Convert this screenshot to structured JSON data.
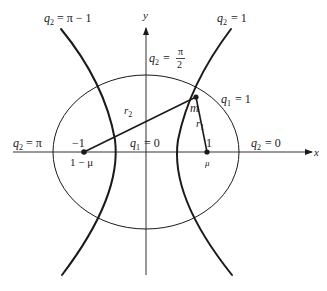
{
  "figure": {
    "axes": {
      "x_label": "x",
      "y_label": "y"
    },
    "labels": {
      "q2_pi_minus_1": {
        "var": "q",
        "sub": "2",
        "eq": "= π − 1"
      },
      "q2_one": {
        "var": "q",
        "sub": "2",
        "eq": "= 1"
      },
      "q2_pi_over_2": {
        "var": "q",
        "sub": "2",
        "eq": "=",
        "num": "π",
        "den": "2"
      },
      "q2_pi": {
        "var": "q",
        "sub": "2",
        "eq": "= π"
      },
      "q2_zero": {
        "var": "q",
        "sub": "2",
        "eq": "= 0"
      },
      "q1_zero": {
        "var": "q",
        "sub": "1",
        "eq": "= 0"
      },
      "q1_one": {
        "var": "q",
        "sub": "1",
        "eq": "= 1"
      }
    },
    "points": {
      "left_primary": {
        "top_label": "−1",
        "bottom_label": "1 − μ"
      },
      "right_primary": {
        "top_label": "1",
        "bottom_label": "μ"
      },
      "mass": {
        "label": "m"
      }
    },
    "segments": {
      "r1": {
        "var": "r",
        "sub": "1"
      },
      "r2": {
        "var": "r",
        "sub": "2"
      }
    }
  }
}
